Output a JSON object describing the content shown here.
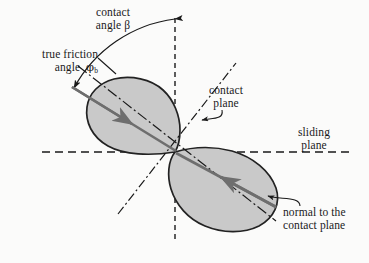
{
  "figure": {
    "kind": "mechanics-diagram",
    "background_color": "#fbfbfa",
    "ink_color": "#1a1a1a",
    "block_fill_color": "#c9c9c9",
    "block_stroke_color": "#222222",
    "force_arrow_color": "#6e6e6e"
  },
  "labels": {
    "contact_angle": {
      "line1": "contact",
      "line2": "angle β",
      "symbol": "β",
      "name": "contact angle beta"
    },
    "true_friction_angle": {
      "line1": "true friction",
      "line2_prefix": "angle",
      "symbol": "φ",
      "subscript": "b",
      "name": "true friction angle phi-b"
    },
    "contact_plane": {
      "line1": "contact",
      "line2": "plane",
      "name": "contact plane"
    },
    "sliding_plane": {
      "line1": "sliding",
      "line2": "plane",
      "name": "sliding plane"
    },
    "normal_to_contact_plane": {
      "line1": "normal to the",
      "line2": "contact plane",
      "name": "normal to the contact plane"
    }
  },
  "geometry": {
    "contact_point": {
      "x": 175,
      "y": 152
    },
    "vertical_reference_line": {
      "x": 175,
      "y_top": 18,
      "y_bottom": 240,
      "style": "dashed"
    },
    "sliding_plane_line": {
      "y": 152,
      "x_left": 42,
      "x_right": 352,
      "style": "dashed"
    },
    "contact_plane_line": {
      "x1": 78,
      "y1": 66,
      "x2": 272,
      "y2": 218,
      "style": "dash-dot"
    },
    "normal_line": {
      "x1": 120,
      "y1": 212,
      "x2": 232,
      "y2": 92,
      "style": "dash-dot-short"
    },
    "contact_angle_arc": {
      "from_deg": 90,
      "to_deg": 146,
      "radius": 134
    },
    "friction_angle_tick": {
      "x": 107,
      "y": 66
    },
    "upper_block_arrow": {
      "x1": 80,
      "y1": 92,
      "x2": 176,
      "y2": 151,
      "head": "down-right"
    },
    "lower_block_arrow": {
      "x1": 272,
      "y1": 206,
      "x2": 176,
      "y2": 153,
      "head": "up-left"
    }
  }
}
